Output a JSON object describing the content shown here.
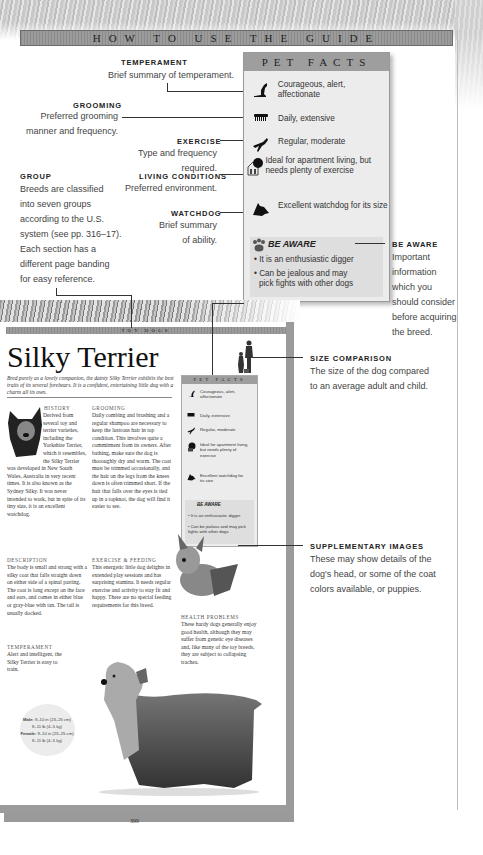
{
  "header": {
    "title": "HOW TO USE THE GUIDE"
  },
  "annotations": {
    "temperament": {
      "label": "TEMPERAMENT",
      "text": "Brief summary of temperament."
    },
    "grooming": {
      "label": "GROOMING",
      "text_line1": "Preferred grooming",
      "text_line2": "manner and frequency."
    },
    "exercise": {
      "label": "EXERCISE",
      "text": "Type and frequency required."
    },
    "living": {
      "label": "LIVING CONDITIONS",
      "text": "Preferred environment."
    },
    "watchdog": {
      "label": "WATCHDOG",
      "text_line1": "Brief summary",
      "text_line2": "of ability."
    },
    "group": {
      "label": "GROUP",
      "lines": [
        "Breeds are classified",
        "into seven groups",
        "according to the U.S.",
        "system (see pp. 316–17).",
        "Each section has a",
        "different page banding",
        "for easy reference."
      ]
    },
    "be_aware": {
      "label": "BE AWARE",
      "lines": [
        "Important",
        "information",
        "which you",
        "should consider",
        "before acquiring",
        "the breed."
      ]
    },
    "size_comparison": {
      "label": "SIZE COMPARISON",
      "lines": [
        "The size of the dog compared",
        "to an average adult and child."
      ]
    },
    "supplementary": {
      "label": "SUPPLEMENTARY IMAGES",
      "lines": [
        "These may show details of the",
        "dog's head, or some of the coat",
        "colors available, or puppies."
      ]
    }
  },
  "pet_facts": {
    "title": "PET FACTS",
    "items": [
      {
        "icon": "temperament-dog-icon",
        "text": "Courageous, alert, affectionate"
      },
      {
        "icon": "comb-icon",
        "text": "Daily, extensive"
      },
      {
        "icon": "running-dog-icon",
        "text": "Regular, moderate"
      },
      {
        "icon": "house-tree-icon",
        "text": "Ideal for apartment living, but needs plenty of exercise"
      },
      {
        "icon": "watchdog-head-icon",
        "text": "Excellent watchdog for its size"
      }
    ],
    "be_aware": {
      "title": "BE AWARE",
      "bullets": [
        "It is an enthusiastic digger",
        "Can be jealous and may pick fights with other dogs"
      ]
    }
  },
  "book_page": {
    "band": "TOY DOGS",
    "title": "Silky Terrier",
    "intro": "Bred purely as a lovely companion, the dainty Silky Terrier exhibits the best traits of its several forebears. It is a confident, entertaining little dog with a charm all its own.",
    "sections": {
      "history": {
        "heading": "History",
        "text": "Derived from several toy and terrier varieties, including the Yorkshire Terrier, which it resembles, the Silky Terrier was developed in New South Wales, Australia in very recent times. It is also known as the Sydney Silky. It was never intended to work, but in spite of its tiny size, it is an excellent watchdog."
      },
      "grooming": {
        "heading": "Grooming",
        "text": "Daily combing and brushing and a regular shampoo are necessary to keep the lustrous hair in top condition. This involves quite a commitment from its owners. After bathing, make sure the dog is thoroughly dry and warm. The coat must be trimmed occasionally, and the hair on the legs from the knees down is often trimmed short. If the hair that falls over the eyes is tied up in a topknot, the dog will find it easier to see."
      },
      "description": {
        "heading": "Description",
        "text": "The body is small and strong with a silky coat that falls straight down on either side of a spinal parting. The coat is long except on the face and ears, and comes in either blue or gray-blue with tan. The tail is usually docked."
      },
      "exercise": {
        "heading": "Exercise & Feeding",
        "text": "This energetic little dog delights in extended play sessions and has surprising stamina. It needs regular exercise and activity to stay fit and happy. There are no special feeding requirements for this breed."
      },
      "temperament": {
        "heading": "Temperament",
        "text": "Alert and intelligent, the Silky Terrier is easy to train."
      },
      "health": {
        "heading": "Health Problems",
        "text": "These hardy dogs generally enjoy good health, although they may suffer from genetic eye diseases and, like many of the toy breeds, they are subject to collapsing trachea."
      }
    },
    "stats": {
      "male_label": "Male:",
      "male_height": "9–10 in (23–25 cm)",
      "male_weight": "8–11 lb (4–5 kg)",
      "female_label": "Female:",
      "female_height": "9–10 in (23–25 cm)",
      "female_weight": "8–11 lb (4–5 kg)"
    },
    "page_number": "399"
  }
}
